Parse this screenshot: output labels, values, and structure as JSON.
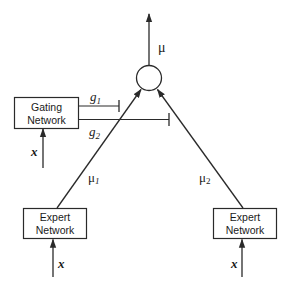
{
  "diagram": {
    "type": "mixture-of-experts",
    "colors": {
      "stroke": "#2a2a2a",
      "text": "#1a1a1a",
      "background": "#ffffff"
    },
    "output": {
      "label": "μ"
    },
    "combiner": {
      "shape": "circle"
    },
    "gating_network": {
      "line1": "Gating",
      "line2": "Network",
      "input_label": "x",
      "gate_labels": {
        "g1_base": "g",
        "g1_sub": "1",
        "g2_base": "g",
        "g2_sub": "2"
      }
    },
    "experts": [
      {
        "line1": "Expert",
        "line2": "Network",
        "input_label": "x",
        "output_base": "μ",
        "output_sub": "1"
      },
      {
        "line1": "Expert",
        "line2": "Network",
        "input_label": "x",
        "output_base": "μ",
        "output_sub": "2"
      }
    ]
  }
}
